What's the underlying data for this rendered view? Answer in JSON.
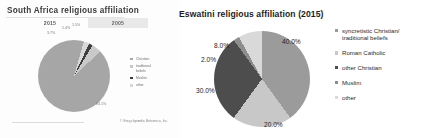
{
  "left_chart": {
    "title": "South Africa religious affiliation",
    "years": [
      {
        "label": "2015",
        "selected": false
      },
      {
        "label": "2005",
        "selected": true
      }
    ],
    "labels": [
      "3.7%",
      "1.4%",
      "1.5%",
      "83.1%"
    ],
    "legend": [
      {
        "label": "Christian",
        "color": "#a6a6a6"
      },
      {
        "label": "traditional\nbeliefs",
        "color": "#c9c9c9"
      },
      {
        "label": "Muslim",
        "color": "#3e3e3e"
      },
      {
        "label": "other",
        "color": "#d8d8d8"
      }
    ],
    "credit": "© Encyclopædia Britannica, Inc."
  },
  "right_chart": {
    "title": "Eswatini religious affiliation (2015)"
  },
  "chart_data": {
    "type": "pie",
    "title": "Eswatini religious affiliation (2015)",
    "categories": [
      "syncretistic Christian/\ntraditional beliefs",
      "Roman Catholic",
      "other Christian",
      "Muslim",
      "other"
    ],
    "values": [
      40.0,
      20.0,
      30.0,
      2.0,
      8.0
    ],
    "value_labels": [
      "40.0%",
      "20.0%",
      "30.0%",
      "2.0%",
      "8.0%"
    ],
    "colors": [
      "#9b9b9b",
      "#c8c8c8",
      "#4d4d4d",
      "#8d8d8d",
      "#d9d9d9"
    ],
    "legend_position": "right",
    "units": "percent"
  }
}
